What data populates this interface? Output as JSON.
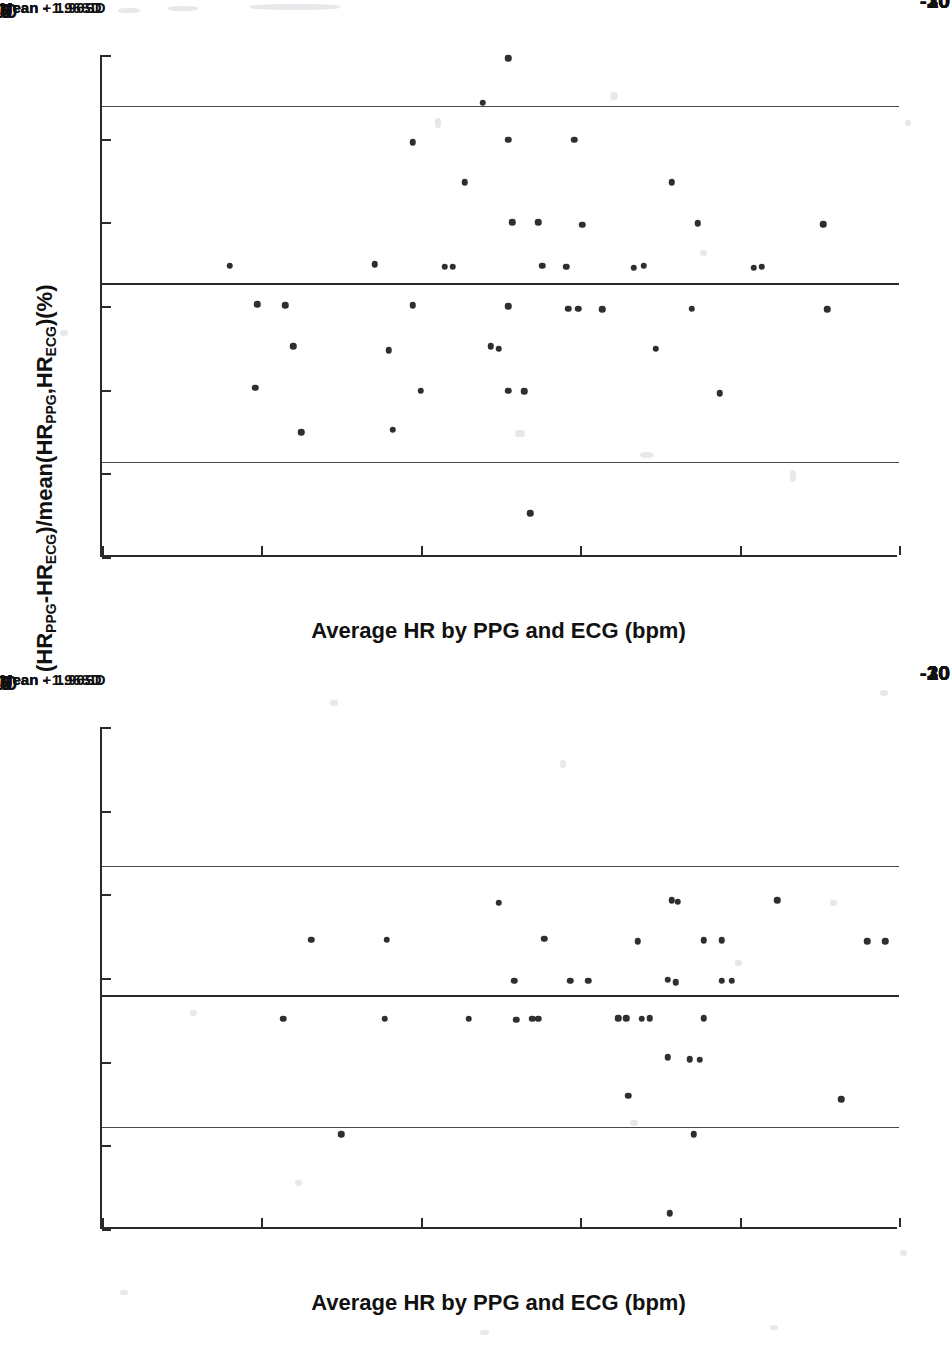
{
  "page": {
    "top_fragment": "",
    "background": "#ffffff",
    "ink_color": "#2b2b2b",
    "point_color": "#2f2f2f"
  },
  "chart_data": [
    {
      "id": "bland-altman-top",
      "type": "scatter",
      "title": "",
      "xlabel": "Average HR by PPG and ECG (bpm)",
      "ylabel": "(HR_PPG-HR_ECG)/mean(HR_PPG,HR_ECG)(%)",
      "ylabel_parts": {
        "p1": "(HR",
        "sub1": "PPG",
        "p2": "-HR",
        "sub2": "ECG",
        "p3": ")/mean(HR",
        "sub3": "PPG",
        "p4": ",HR",
        "sub4": "ECG",
        "p5": ")(%)"
      },
      "xlim": [
        60,
        100
      ],
      "ylim": [
        -30,
        30
      ],
      "xticks": [
        60,
        68,
        76,
        84,
        92,
        100
      ],
      "xticklabels": [
        "60",
        "68",
        "76",
        "84",
        "",
        "100"
      ],
      "extra_xticklabel": {
        "value": 96,
        "label": "96"
      },
      "yticks": [
        30,
        20,
        10,
        0,
        -10,
        -20,
        -30
      ],
      "yticklabels": [
        "30",
        "20",
        "10",
        "0",
        "-10",
        "-20",
        "-30"
      ],
      "grid": false,
      "reference_lines": [
        {
          "name": "upper-loa",
          "label": "Mean + 1.96SD",
          "value": 23.9
        },
        {
          "name": "mean",
          "label": "Mean",
          "value": 2.7
        },
        {
          "name": "lower-loa",
          "label": "Mean - 1.96SD",
          "value": -18.6
        }
      ],
      "points": [
        {
          "x": 80.4,
          "y": 29.6
        },
        {
          "x": 79.1,
          "y": 24.3
        },
        {
          "x": 75.6,
          "y": 19.6
        },
        {
          "x": 80.4,
          "y": 19.9
        },
        {
          "x": 83.7,
          "y": 19.9
        },
        {
          "x": 78.2,
          "y": 14.8
        },
        {
          "x": 88.6,
          "y": 14.8
        },
        {
          "x": 80.6,
          "y": 10.0
        },
        {
          "x": 81.9,
          "y": 10.0
        },
        {
          "x": 84.1,
          "y": 9.7
        },
        {
          "x": 89.9,
          "y": 9.9
        },
        {
          "x": 96.2,
          "y": 9.8
        },
        {
          "x": 66.4,
          "y": 4.8
        },
        {
          "x": 73.7,
          "y": 5.0
        },
        {
          "x": 77.2,
          "y": 4.7
        },
        {
          "x": 77.6,
          "y": 4.7
        },
        {
          "x": 82.1,
          "y": 4.8
        },
        {
          "x": 83.3,
          "y": 4.7
        },
        {
          "x": 86.7,
          "y": 4.6
        },
        {
          "x": 87.2,
          "y": 4.8
        },
        {
          "x": 92.7,
          "y": 4.6
        },
        {
          "x": 93.1,
          "y": 4.7
        },
        {
          "x": 67.8,
          "y": 0.2
        },
        {
          "x": 69.2,
          "y": 0.1
        },
        {
          "x": 75.6,
          "y": 0.1
        },
        {
          "x": 80.4,
          "y": 0.0
        },
        {
          "x": 83.4,
          "y": -0.3
        },
        {
          "x": 83.9,
          "y": -0.3
        },
        {
          "x": 85.1,
          "y": -0.4
        },
        {
          "x": 89.6,
          "y": -0.3
        },
        {
          "x": 96.4,
          "y": -0.4
        },
        {
          "x": 69.6,
          "y": -4.8
        },
        {
          "x": 74.4,
          "y": -5.3
        },
        {
          "x": 79.5,
          "y": -4.8
        },
        {
          "x": 79.9,
          "y": -5.1
        },
        {
          "x": 87.8,
          "y": -5.1
        },
        {
          "x": 67.7,
          "y": -9.8
        },
        {
          "x": 76.0,
          "y": -10.1
        },
        {
          "x": 80.4,
          "y": -10.1
        },
        {
          "x": 81.2,
          "y": -10.2
        },
        {
          "x": 91.0,
          "y": -10.4
        },
        {
          "x": 70.0,
          "y": -15.1
        },
        {
          "x": 74.6,
          "y": -14.8
        },
        {
          "x": 81.5,
          "y": -24.8
        }
      ]
    },
    {
      "id": "bland-altman-bottom",
      "type": "scatter",
      "title": "",
      "xlabel": "Average HR by PPG and ECG (bpm)",
      "ylabel": "(HR_PPG-HR_ECG)/mean(HR_PPG,HR_ECG)(%)",
      "ylabel_parts": {
        "p1": "(HR",
        "sub1": "PPG",
        "p2": "-HR",
        "sub2": "ECG",
        "p3": ")/mean(HR",
        "sub3": "PPG",
        "p4": ",HR",
        "sub4": "ECG",
        "p5": ")(%)"
      },
      "xlim": [
        60,
        100
      ],
      "ylim": [
        -30,
        30
      ],
      "xticks": [
        60,
        68,
        76,
        84,
        92,
        100
      ],
      "xticklabels": [
        "60",
        "68",
        "76",
        "84",
        "",
        "100"
      ],
      "extra_xticklabel": {
        "value": 96,
        "label": "96"
      },
      "yticks": [
        30,
        20,
        10,
        0,
        -10,
        -20,
        -30
      ],
      "yticklabels": [
        "30",
        "20",
        "10",
        "0",
        "-10",
        "-20",
        "-30"
      ],
      "grid": false,
      "reference_lines": [
        {
          "name": "upper-loa",
          "label": "Mean + 1.96SD",
          "value": 13.4
        },
        {
          "name": "mean",
          "label": "Mean",
          "value": -2.0
        },
        {
          "name": "lower-loa",
          "label": "Mean - 1.96SD",
          "value": -17.8
        }
      ],
      "points": [
        {
          "x": 79.9,
          "y": 9.0
        },
        {
          "x": 88.6,
          "y": 9.3
        },
        {
          "x": 88.9,
          "y": 9.1
        },
        {
          "x": 93.9,
          "y": 9.3
        },
        {
          "x": 70.5,
          "y": 4.6
        },
        {
          "x": 74.3,
          "y": 4.6
        },
        {
          "x": 82.2,
          "y": 4.7
        },
        {
          "x": 86.9,
          "y": 4.4
        },
        {
          "x": 90.2,
          "y": 4.5
        },
        {
          "x": 91.1,
          "y": 4.5
        },
        {
          "x": 98.4,
          "y": 4.4
        },
        {
          "x": 99.3,
          "y": 4.4
        },
        {
          "x": 80.7,
          "y": -0.3
        },
        {
          "x": 83.5,
          "y": -0.3
        },
        {
          "x": 84.4,
          "y": -0.3
        },
        {
          "x": 88.4,
          "y": -0.2
        },
        {
          "x": 88.8,
          "y": -0.5
        },
        {
          "x": 91.1,
          "y": -0.3
        },
        {
          "x": 91.6,
          "y": -0.3
        },
        {
          "x": 69.1,
          "y": -4.9
        },
        {
          "x": 74.2,
          "y": -4.9
        },
        {
          "x": 78.4,
          "y": -4.9
        },
        {
          "x": 80.8,
          "y": -5.0
        },
        {
          "x": 81.6,
          "y": -4.9
        },
        {
          "x": 81.9,
          "y": -4.9
        },
        {
          "x": 85.9,
          "y": -4.8
        },
        {
          "x": 86.3,
          "y": -4.8
        },
        {
          "x": 87.1,
          "y": -4.9
        },
        {
          "x": 87.5,
          "y": -4.8
        },
        {
          "x": 90.2,
          "y": -4.8
        },
        {
          "x": 88.4,
          "y": -9.5
        },
        {
          "x": 89.5,
          "y": -9.7
        },
        {
          "x": 90.0,
          "y": -9.8
        },
        {
          "x": 86.4,
          "y": -14.1
        },
        {
          "x": 97.1,
          "y": -14.5
        },
        {
          "x": 72.0,
          "y": -18.7
        },
        {
          "x": 89.7,
          "y": -18.7
        },
        {
          "x": 88.5,
          "y": -28.1
        }
      ]
    }
  ]
}
